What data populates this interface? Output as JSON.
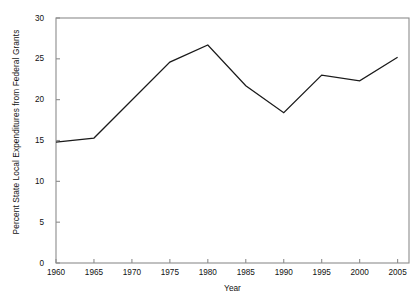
{
  "chart_data": {
    "type": "line",
    "title": "",
    "xlabel": "Year",
    "ylabel": "Percent State Local Expenditures from Federal Grants",
    "x": [
      1960,
      1965,
      1975,
      1980,
      1985,
      1990,
      1995,
      2000,
      2005
    ],
    "values": [
      14.8,
      15.3,
      24.6,
      26.7,
      21.7,
      18.4,
      23.0,
      22.3,
      25.2
    ],
    "series": [
      {
        "name": "Percent State Local Expenditures from Federal Grants",
        "x": [
          1960,
          1965,
          1975,
          1980,
          1985,
          1990,
          1995,
          2000,
          2005
        ],
        "values": [
          14.8,
          15.3,
          24.6,
          26.7,
          21.7,
          18.4,
          23.0,
          22.3,
          25.2
        ]
      }
    ],
    "xlim": [
      1960,
      2006.5
    ],
    "ylim": [
      0,
      30
    ],
    "xticks": [
      1960,
      1965,
      1970,
      1975,
      1980,
      1985,
      1990,
      1995,
      2000,
      2005
    ],
    "xtick_labels": [
      "1960",
      "1965",
      "1970",
      "1975",
      "1980",
      "1985",
      "1990",
      "1995",
      "2000",
      "2005"
    ],
    "yticks": [
      0,
      5,
      10,
      15,
      20,
      25,
      30
    ],
    "ytick_labels": [
      "0",
      "5",
      "10",
      "15",
      "20",
      "25",
      "30"
    ],
    "grid": false,
    "legend": false,
    "legend_position": "none",
    "line_color": "#1a1a1a",
    "frame_color": "#8c8c8c",
    "background_color": "#ffffff"
  }
}
